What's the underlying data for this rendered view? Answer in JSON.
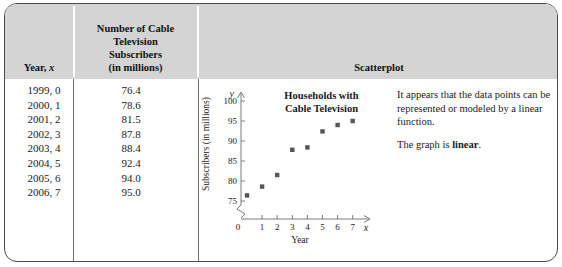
{
  "table": {
    "headers": {
      "year": "Year, x",
      "year_prefix": "Year, ",
      "year_var": "x",
      "subscribers_line1": "Number of Cable",
      "subscribers_line2": "Television",
      "subscribers_line3": "Subscribers",
      "subscribers_line4": "(in millions)",
      "scatterplot": "Scatterplot"
    },
    "rows": [
      {
        "year": "1999,  0",
        "value": "76.4"
      },
      {
        "year": "2000,  1",
        "value": "78.6"
      },
      {
        "year": "2001,  2",
        "value": "81.5"
      },
      {
        "year": "2002,  3",
        "value": "87.8"
      },
      {
        "year": "2003,  4",
        "value": "88.4"
      },
      {
        "year": "2004,  5",
        "value": "92.4"
      },
      {
        "year": "2005,  6",
        "value": "94.0"
      },
      {
        "year": "2006,  7",
        "value": "95.0"
      }
    ]
  },
  "chart_data": {
    "type": "scatter",
    "title": "Households with Cable Television",
    "title_line1": "Households with",
    "title_line2": "Cable Television",
    "xlabel": "Year",
    "ylabel": "Subscribers (in millions)",
    "x_var": "x",
    "y_var": "y",
    "x": [
      0,
      1,
      2,
      3,
      4,
      5,
      6,
      7
    ],
    "values": [
      76.4,
      78.6,
      81.5,
      87.8,
      88.4,
      92.4,
      94.0,
      95.0
    ],
    "xlim": [
      0,
      7.8
    ],
    "ylim": [
      75,
      102
    ],
    "x_ticks": [
      "0",
      "1",
      "2",
      "3",
      "4",
      "5",
      "6",
      "7"
    ],
    "y_ticks": [
      "75",
      "80",
      "85",
      "90",
      "95",
      "100"
    ],
    "y_axis_break": true,
    "grid": false,
    "legend": "none",
    "point_color": "#555555"
  },
  "commentary": {
    "paragraph1": "It appears that the data points can be represented or modeled by a linear function.",
    "p2_prefix": "The graph is ",
    "p2_bold": "linear",
    "p2_suffix": "."
  },
  "colors": {
    "header_bg": "#d4d4d4",
    "frame_border": "#4a4a4a",
    "axis": "#7a7a7a",
    "point": "#555555"
  }
}
